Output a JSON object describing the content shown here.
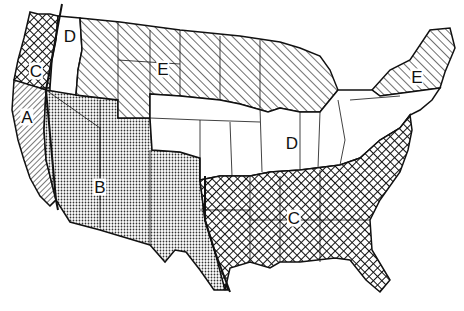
{
  "map": {
    "title": "United States regional zones map",
    "regions": [
      {
        "id": "A",
        "label": "A",
        "pattern": "fine-diagonal-backslash",
        "area": "California coast"
      },
      {
        "id": "B",
        "label": "B",
        "pattern": "stipple-dots",
        "area": "Southwest / Great Basin / Texas west"
      },
      {
        "id": "C",
        "label": "C",
        "pattern": "crosshatch",
        "area": "Pacific Northwest coast and Southeast"
      },
      {
        "id": "D",
        "label": "D",
        "pattern": "blank",
        "area": "Eastern Washington/Oregon and Central/Midwest"
      },
      {
        "id": "E",
        "label": "E",
        "pattern": "diagonal-slash",
        "area": "Northern tier and New England"
      }
    ],
    "labels": [
      {
        "text": "D",
        "x": 70,
        "y": 36
      },
      {
        "text": "C",
        "x": 36,
        "y": 71
      },
      {
        "text": "A",
        "x": 27,
        "y": 117
      },
      {
        "text": "E",
        "x": 163,
        "y": 69
      },
      {
        "text": "E",
        "x": 417,
        "y": 77
      },
      {
        "text": "D",
        "x": 292,
        "y": 143
      },
      {
        "text": "B",
        "x": 100,
        "y": 187
      },
      {
        "text": "C",
        "x": 294,
        "y": 218
      }
    ]
  }
}
